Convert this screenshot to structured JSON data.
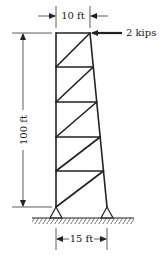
{
  "diagram": {
    "type": "truss-tower",
    "labels": {
      "top_width": "10 ft",
      "height": "100 ft",
      "base_width": "15 ft",
      "load": "2 kips"
    },
    "geometry": {
      "left_x": 56,
      "top_y": 33,
      "bottom_y": 207,
      "top_right_x": 90,
      "bottom_right_x": 107,
      "panel_count": 5,
      "ground_y": 218
    },
    "colors": {
      "line": "#222222",
      "text": "#1a1a1a",
      "background": "#ffffff"
    }
  }
}
